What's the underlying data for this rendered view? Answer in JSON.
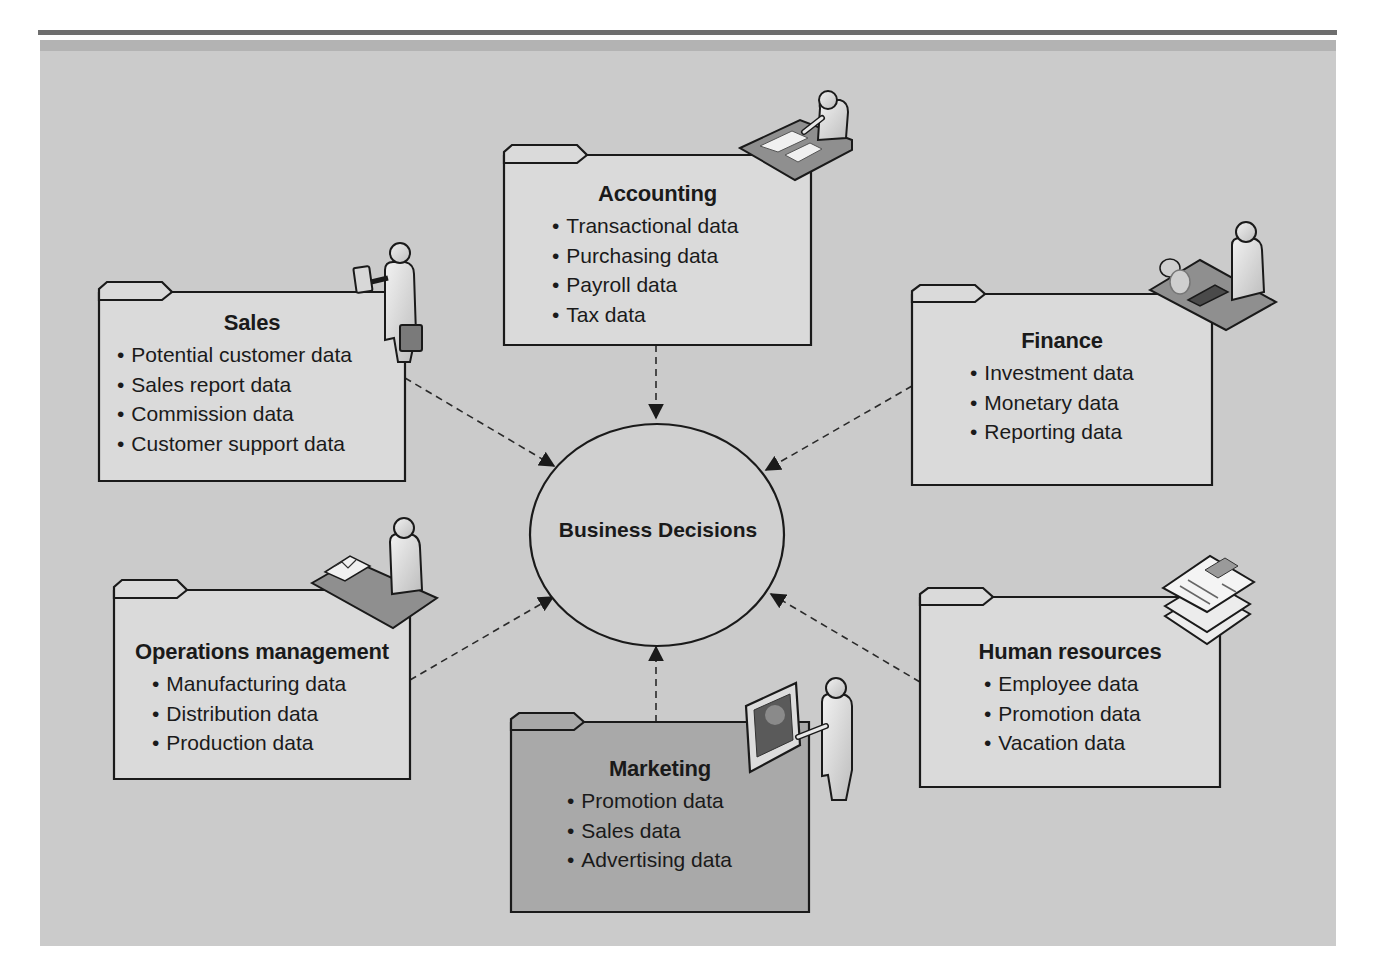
{
  "diagram": {
    "center": {
      "label": "Business Decisions"
    },
    "departments": [
      {
        "id": "accounting",
        "title": "Accounting",
        "items": [
          "Transactional data",
          "Purchasing data",
          "Payroll data",
          "Tax data"
        ],
        "icon": "person-at-desk-with-papers-icon"
      },
      {
        "id": "sales",
        "title": "Sales",
        "items": [
          "Potential customer data",
          "Sales report data",
          "Commission data",
          "Customer support data"
        ],
        "icon": "person-with-briefcase-and-phone-icon"
      },
      {
        "id": "finance",
        "title": "Finance",
        "items": [
          "Investment data",
          "Monetary data",
          "Reporting data"
        ],
        "icon": "person-at-desk-with-coins-and-calculator-icon"
      },
      {
        "id": "operations",
        "title": "Operations management",
        "items": [
          "Manufacturing data",
          "Distribution data",
          "Production data"
        ],
        "icon": "person-at-desk-with-reports-icon"
      },
      {
        "id": "marketing",
        "title": "Marketing",
        "items": [
          "Promotion data",
          "Sales data",
          "Advertising data"
        ],
        "icon": "person-presenting-chart-icon"
      },
      {
        "id": "hr",
        "title": "Human resources",
        "items": [
          "Employee data",
          "Promotion data",
          "Vacation data"
        ],
        "icon": "stacked-resumes-icon"
      }
    ],
    "connector_style": "dashed-arrow-to-center",
    "colors": {
      "panel": "#cbcbcb",
      "folder_light": "#dcdcdc",
      "folder_marketing": "#a9a9a9",
      "stroke": "#1a1a1a",
      "top_rule": "#6e6e6e"
    }
  }
}
